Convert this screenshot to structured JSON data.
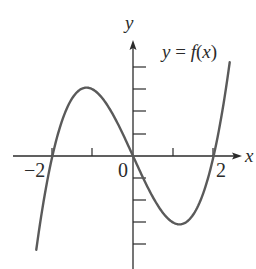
{
  "chart_data": {
    "type": "line",
    "title": "",
    "function_label": "y = f(x)",
    "xlabel": "x",
    "ylabel": "y",
    "xlim": [
      -3,
      2.7
    ],
    "ylim": [
      -5,
      5.2
    ],
    "x_ticks": [
      -2,
      -1,
      0,
      1,
      2
    ],
    "x_tick_labels": [
      "-2",
      "0",
      "2"
    ],
    "y_ticks": [
      -4,
      -3,
      -2,
      -1,
      1,
      2,
      3,
      4
    ],
    "y_tick_labels": [],
    "grid": false,
    "legend": null,
    "series": [
      {
        "name": "f(x) = x^3 - 4x",
        "x": [
          -2.4,
          -2.2,
          -2.0,
          -1.8,
          -1.6,
          -1.4,
          -1.155,
          -1.0,
          -0.8,
          -0.6,
          -0.4,
          -0.2,
          0.0,
          0.2,
          0.4,
          0.6,
          0.8,
          1.0,
          1.155,
          1.4,
          1.6,
          1.8,
          2.0,
          2.2,
          2.4
        ],
        "values": [
          -4.22,
          -1.85,
          0.0,
          1.37,
          2.3,
          2.86,
          3.08,
          3.0,
          2.69,
          2.18,
          1.54,
          0.79,
          0.0,
          -0.79,
          -1.54,
          -2.18,
          -2.69,
          -3.0,
          -3.08,
          -2.86,
          -2.3,
          -1.37,
          0.0,
          1.85,
          4.22
        ]
      }
    ],
    "zeros": [
      -2,
      0,
      2
    ],
    "local_max": {
      "x": -1.155,
      "y": 3.08
    },
    "local_min": {
      "x": 1.155,
      "y": -3.08
    }
  },
  "labels": {
    "y_axis": "y",
    "x_axis": "x",
    "func_y": "y",
    "func_eq": " = ",
    "func_f": "f",
    "func_paren_open": "(",
    "func_x": "x",
    "func_paren_close": ")",
    "tick_neg2": "−2",
    "tick_0": "0",
    "tick_2": "2"
  },
  "colors": {
    "curve": "#5a5a5a",
    "axis": "#2b2b2b"
  }
}
